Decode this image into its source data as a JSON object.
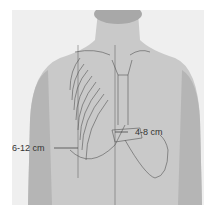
{
  "figure": {
    "labels": {
      "midclavicular_span": "6-12 cm",
      "midline_span": "4-8 cm"
    }
  }
}
